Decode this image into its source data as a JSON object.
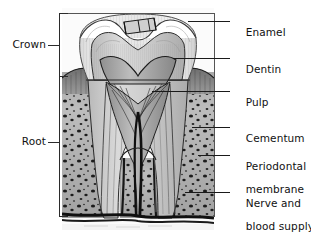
{
  "figure": {
    "ink_color": "#111111",
    "line_color": "#2b2b2b",
    "frame_color": "#555555",
    "background_color": "#ffffff"
  },
  "left_labels": [
    {
      "id": "crown",
      "text": "Crown"
    },
    {
      "id": "root",
      "text": "Root"
    }
  ],
  "right_labels": [
    {
      "id": "enamel",
      "line1": "Enamel",
      "line2": ""
    },
    {
      "id": "dentin",
      "line1": "Dentin",
      "line2": ""
    },
    {
      "id": "pulp",
      "line1": "Pulp",
      "line2": ""
    },
    {
      "id": "cementum",
      "line1": "Cementum",
      "line2": ""
    },
    {
      "id": "periodontal-membrane",
      "line1": "Periodontal",
      "line2": "membrane"
    },
    {
      "id": "nerve-blood-supply",
      "line1": "Nerve and",
      "line2": "blood supply"
    }
  ]
}
